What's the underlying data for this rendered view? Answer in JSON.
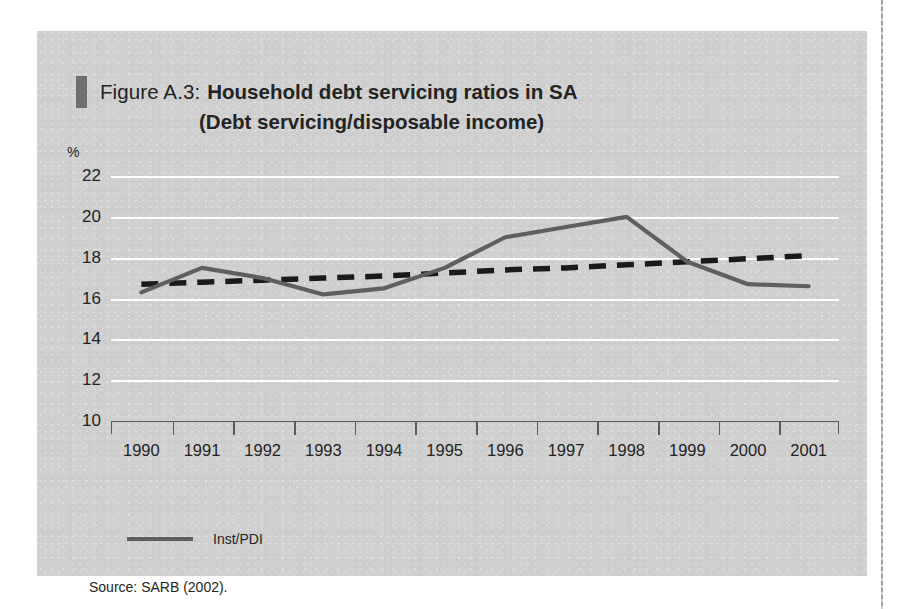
{
  "figure": {
    "label": "Figure A.3:",
    "title_line1": "Household debt servicing ratios in SA",
    "title_line2": "(Debt servicing/disposable income)",
    "source": "Source: SARB (2002)."
  },
  "colors": {
    "panel_background": "#cfcfcf",
    "gridline": "#fdfdfd",
    "series_line": "#5f5f5f",
    "trend_line": "#1a1a1a",
    "axis": "#5a5a5a",
    "text": "#232323",
    "title_marker": "#6f6f6f"
  },
  "chart_data": {
    "type": "line",
    "title": "Household debt servicing ratios in SA (Debt servicing/disposable income)",
    "xlabel": "",
    "ylabel": "%",
    "ylim": [
      10,
      22
    ],
    "yticks": [
      10,
      12,
      14,
      16,
      18,
      20,
      22
    ],
    "grid": true,
    "legend_position": "below-left",
    "categories": [
      "1990",
      "1991",
      "1992",
      "1993",
      "1994",
      "1995",
      "1996",
      "1997",
      "1998",
      "1999",
      "2000",
      "2001"
    ],
    "series": [
      {
        "name": "Inst/PDI",
        "style": "solid",
        "color": "#5f5f5f",
        "values": [
          16.3,
          17.5,
          17.0,
          16.2,
          16.5,
          17.5,
          19.0,
          19.5,
          20.0,
          17.8,
          16.7,
          16.6
        ]
      },
      {
        "name": "Trend",
        "style": "dashed",
        "color": "#1a1a1a",
        "values": [
          16.7,
          16.8,
          16.9,
          17.0,
          17.1,
          17.25,
          17.4,
          17.5,
          17.65,
          17.8,
          17.95,
          18.1
        ]
      }
    ]
  },
  "legend": {
    "items": [
      {
        "label": "Inst/PDI",
        "swatch": "solid-line-swatch"
      }
    ]
  }
}
